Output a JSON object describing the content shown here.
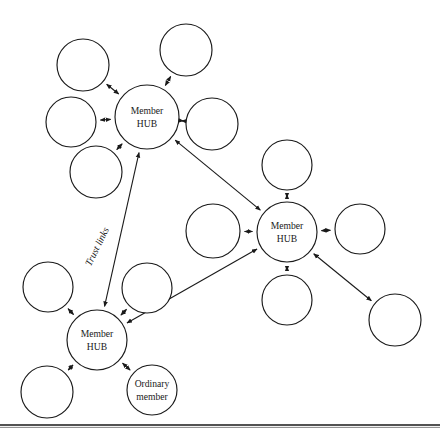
{
  "figure": {
    "background_color": "#ffffff",
    "stroke_color": "#1a1a1a",
    "width": 440,
    "height": 440
  },
  "labels": {
    "hub_line1": "Member",
    "hub_line2": "HUB",
    "ordinary_line1": "Ordinary",
    "ordinary_line2": "member",
    "trust_links": "Trust links"
  },
  "nodes": [
    {
      "id": "hub-top",
      "kind": "hub",
      "cx": 147,
      "cy": 117,
      "r": 32,
      "line1": "Member",
      "line2": "HUB"
    },
    {
      "id": "hub-center",
      "kind": "hub",
      "cx": 287,
      "cy": 232,
      "r": 30,
      "line1": "Member",
      "line2": "HUB"
    },
    {
      "id": "hub-bottom",
      "kind": "hub",
      "cx": 97,
      "cy": 340,
      "r": 30,
      "line1": "Member",
      "line2": "HUB"
    },
    {
      "id": "ordinary-member",
      "kind": "ordinary",
      "cx": 152,
      "cy": 390,
      "r": 25,
      "line1": "Ordinary",
      "line2": "member"
    },
    {
      "id": "sat-top-a",
      "kind": "plain",
      "cx": 83,
      "cy": 65,
      "r": 26,
      "line1": "",
      "line2": ""
    },
    {
      "id": "sat-top-b",
      "kind": "plain",
      "cx": 186,
      "cy": 50,
      "r": 26,
      "line1": "",
      "line2": ""
    },
    {
      "id": "sat-top-c",
      "kind": "plain",
      "cx": 71,
      "cy": 122,
      "r": 25,
      "line1": "",
      "line2": ""
    },
    {
      "id": "sat-top-d",
      "kind": "plain",
      "cx": 212,
      "cy": 124,
      "r": 26,
      "line1": "",
      "line2": ""
    },
    {
      "id": "sat-top-e",
      "kind": "plain",
      "cx": 96,
      "cy": 172,
      "r": 26,
      "line1": "",
      "line2": ""
    },
    {
      "id": "sat-center-n",
      "kind": "plain",
      "cx": 287,
      "cy": 165,
      "r": 25,
      "line1": "",
      "line2": ""
    },
    {
      "id": "sat-center-w",
      "kind": "plain",
      "cx": 213,
      "cy": 231,
      "r": 27,
      "line1": "",
      "line2": ""
    },
    {
      "id": "sat-center-e",
      "kind": "plain",
      "cx": 360,
      "cy": 229,
      "r": 25,
      "line1": "",
      "line2": ""
    },
    {
      "id": "sat-center-s",
      "kind": "plain",
      "cx": 287,
      "cy": 300,
      "r": 25,
      "line1": "",
      "line2": ""
    },
    {
      "id": "sat-center-se",
      "kind": "plain",
      "cx": 395,
      "cy": 320,
      "r": 26,
      "line1": "",
      "line2": ""
    },
    {
      "id": "sat-bottom-nw",
      "kind": "plain",
      "cx": 48,
      "cy": 287,
      "r": 25,
      "line1": "",
      "line2": ""
    },
    {
      "id": "sat-bottom-ne",
      "kind": "plain",
      "cx": 147,
      "cy": 288,
      "r": 25,
      "line1": "",
      "line2": ""
    },
    {
      "id": "sat-bottom-sw",
      "kind": "plain",
      "cx": 47,
      "cy": 392,
      "r": 26,
      "line1": "",
      "line2": ""
    }
  ],
  "links": [
    {
      "id": "link-top-a",
      "from": "hub-top",
      "to": "sat-top-a",
      "arrows": "both"
    },
    {
      "id": "link-top-b",
      "from": "hub-top",
      "to": "sat-top-b",
      "arrows": "both"
    },
    {
      "id": "link-top-c",
      "from": "hub-top",
      "to": "sat-top-c",
      "arrows": "both"
    },
    {
      "id": "link-top-d",
      "from": "hub-top",
      "to": "sat-top-d",
      "arrows": "both"
    },
    {
      "id": "link-top-e",
      "from": "hub-top",
      "to": "sat-top-e",
      "arrows": "both"
    },
    {
      "id": "link-center-n",
      "from": "hub-center",
      "to": "sat-center-n",
      "arrows": "both"
    },
    {
      "id": "link-center-w",
      "from": "hub-center",
      "to": "sat-center-w",
      "arrows": "both"
    },
    {
      "id": "link-center-e",
      "from": "hub-center",
      "to": "sat-center-e",
      "arrows": "both"
    },
    {
      "id": "link-center-s",
      "from": "hub-center",
      "to": "sat-center-s",
      "arrows": "both"
    },
    {
      "id": "link-center-se",
      "from": "hub-center",
      "to": "sat-center-se",
      "arrows": "both"
    },
    {
      "id": "link-bottom-nw",
      "from": "hub-bottom",
      "to": "sat-bottom-nw",
      "arrows": "both"
    },
    {
      "id": "link-bottom-ne",
      "from": "hub-bottom",
      "to": "sat-bottom-ne",
      "arrows": "both"
    },
    {
      "id": "link-bottom-sw",
      "from": "hub-bottom",
      "to": "sat-bottom-sw",
      "arrows": "both"
    },
    {
      "id": "link-bottom-ordinary",
      "from": "hub-bottom",
      "to": "ordinary-member",
      "arrows": "both"
    },
    {
      "id": "trust-top-center",
      "from": "hub-top",
      "to": "hub-center",
      "arrows": "both",
      "trust": true
    },
    {
      "id": "trust-top-bottom",
      "from": "hub-top",
      "to": "hub-bottom",
      "arrows": "both",
      "trust": true
    },
    {
      "id": "trust-center-bottom",
      "from": "hub-center",
      "to": "hub-bottom",
      "arrows": "both",
      "trust": true
    }
  ],
  "trust_label": {
    "x": 100,
    "y": 248,
    "rotation": -64
  },
  "footer_rule": {
    "y": 425,
    "x1": 0,
    "x2": 440
  }
}
